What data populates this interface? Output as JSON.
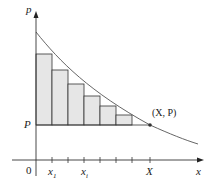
{
  "diagram": {
    "labels": {
      "y_axis": "p",
      "x_axis": "x",
      "origin": "0",
      "price_level": "P",
      "point": "(X, P)",
      "x_end": "X",
      "x1": "x",
      "x1_sub": "1",
      "xi": "x",
      "xi_sub": "i"
    },
    "rectangle_count": 6,
    "tick_count": 7,
    "colors": {
      "rect_fill": "#e6e6e6",
      "stroke": "#333333",
      "curve": "#555555"
    }
  }
}
